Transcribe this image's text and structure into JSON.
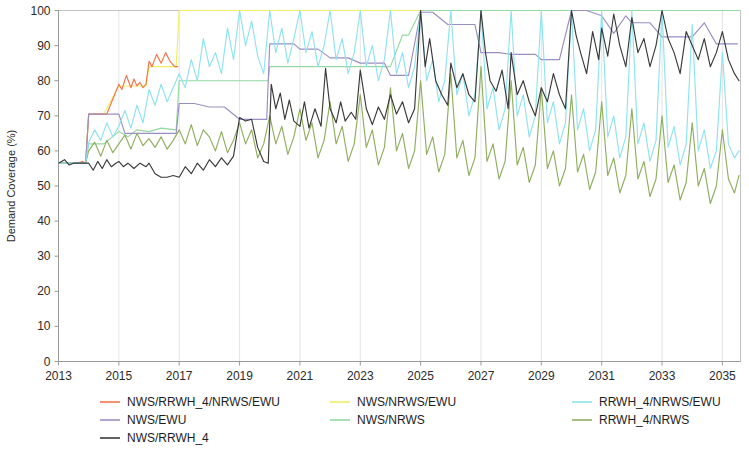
{
  "chart_data": {
    "type": "line",
    "title": "",
    "xlabel": "",
    "ylabel": "Demand Coverage (%)",
    "xlim": [
      2013,
      2035.6
    ],
    "ylim": [
      0,
      100
    ],
    "grid": "vertical-faint",
    "legend_position": "below-plot-three-columns",
    "xticks": [
      "2013",
      "2015",
      "2017",
      "2019",
      "2021",
      "2023",
      "2025",
      "2027",
      "2029",
      "2031",
      "2033",
      "2035"
    ],
    "xtick_values": [
      2013,
      2015,
      2017,
      2019,
      2021,
      2023,
      2025,
      2027,
      2029,
      2031,
      2033,
      2035
    ],
    "yticks": [
      "0",
      "10",
      "20",
      "30",
      "40",
      "50",
      "60",
      "70",
      "80",
      "90",
      "100"
    ],
    "ytick_values": [
      0,
      10,
      20,
      30,
      40,
      50,
      60,
      70,
      80,
      90,
      100
    ],
    "series": [
      {
        "name": "NWS/RRWH_4/NRWS/EWU",
        "color": "#f4744a",
        "x": [
          2013.0,
          2013.6,
          2013.8,
          2013.9,
          2014.0,
          2014.3,
          2014.6,
          2015.0,
          2015.1,
          2015.25,
          2015.4,
          2015.5,
          2015.6,
          2015.7,
          2015.8,
          2015.9,
          2016.0,
          2016.1,
          2016.25,
          2016.4,
          2016.55,
          2016.7,
          2016.85,
          2016.95
        ],
        "values": [
          56.5,
          56.5,
          57.0,
          56.5,
          70.5,
          70.5,
          70.5,
          79.0,
          77.5,
          81.5,
          78.0,
          80.5,
          78.5,
          79.5,
          78.0,
          79.0,
          85.5,
          84.0,
          87.5,
          85.0,
          88.0,
          85.5,
          84.0,
          84.0
        ]
      },
      {
        "name": "NWS/EWU",
        "color": "#9b8ec4",
        "x": [
          2013.0,
          2013.9,
          2014.0,
          2014.5,
          2015.0,
          2015.2,
          2015.5,
          2016.0,
          2016.5,
          2016.9,
          2017.0,
          2017.5,
          2018.0,
          2018.5,
          2019.0,
          2019.5,
          2019.9,
          2020.0,
          2020.8,
          2021.0,
          2021.6,
          2022.0,
          2022.6,
          2023.0,
          2023.8,
          2024.0,
          2024.6,
          2025.0,
          2025.4,
          2025.9,
          2026.0,
          2026.8,
          2027.0,
          2027.6,
          2028.0,
          2028.8,
          2029.0,
          2029.6,
          2030.0,
          2030.5,
          2031.0,
          2031.4,
          2031.8,
          2032.0,
          2032.6,
          2033.0,
          2033.5,
          2034.0,
          2034.4,
          2034.8,
          2035.0,
          2035.5
        ],
        "values": [
          56.5,
          56.5,
          70.5,
          70.5,
          70.5,
          65.0,
          65.0,
          65.0,
          65.0,
          65.0,
          73.5,
          73.5,
          72.5,
          72.5,
          69.0,
          69.0,
          69.0,
          90.5,
          90.5,
          89.0,
          89.0,
          86.5,
          86.5,
          85.0,
          85.0,
          81.5,
          81.5,
          99.5,
          99.5,
          96.0,
          96.0,
          96.0,
          88.0,
          88.0,
          87.5,
          87.5,
          86.0,
          86.0,
          100.0,
          100.0,
          98.5,
          93.5,
          98.5,
          96.5,
          96.5,
          92.5,
          92.5,
          92.5,
          96.5,
          90.5,
          90.5,
          90.5
        ]
      },
      {
        "name": "NWS/RRWH_4",
        "color": "#3a3a3a",
        "x": [
          2013.0,
          2013.2,
          2013.35,
          2013.5,
          2013.7,
          2013.9,
          2014.0,
          2014.15,
          2014.3,
          2014.45,
          2014.6,
          2014.75,
          2014.9,
          2015.0,
          2015.15,
          2015.3,
          2015.5,
          2015.7,
          2015.9,
          2016.0,
          2016.2,
          2016.4,
          2016.6,
          2016.8,
          2017.0,
          2017.2,
          2017.4,
          2017.6,
          2017.8,
          2018.0,
          2018.2,
          2018.4,
          2018.6,
          2018.8,
          2019.0,
          2019.2,
          2019.4,
          2019.6,
          2019.8,
          2019.95,
          2020.05,
          2020.2,
          2020.35,
          2020.5,
          2020.65,
          2020.8,
          2021.0,
          2021.15,
          2021.3,
          2021.5,
          2021.7,
          2021.85,
          2022.0,
          2022.2,
          2022.35,
          2022.5,
          2022.7,
          2022.85,
          2023.0,
          2023.2,
          2023.4,
          2023.6,
          2023.8,
          2024.0,
          2024.2,
          2024.4,
          2024.6,
          2024.8,
          2025.0,
          2025.15,
          2025.3,
          2025.5,
          2025.7,
          2025.9,
          2026.0,
          2026.2,
          2026.4,
          2026.6,
          2026.8,
          2027.0,
          2027.15,
          2027.3,
          2027.5,
          2027.7,
          2027.9,
          2028.0,
          2028.2,
          2028.4,
          2028.6,
          2028.8,
          2029.0,
          2029.2,
          2029.4,
          2029.6,
          2029.8,
          2030.0,
          2030.15,
          2030.3,
          2030.5,
          2030.7,
          2030.9,
          2031.0,
          2031.2,
          2031.4,
          2031.6,
          2031.8,
          2032.0,
          2032.2,
          2032.4,
          2032.6,
          2032.8,
          2033.0,
          2033.2,
          2033.4,
          2033.6,
          2033.8,
          2034.0,
          2034.2,
          2034.4,
          2034.6,
          2034.8,
          2035.0,
          2035.2,
          2035.4,
          2035.55
        ],
        "values": [
          56.5,
          57.5,
          56.0,
          56.5,
          56.5,
          56.5,
          56.5,
          54.5,
          57.0,
          55.0,
          57.5,
          55.5,
          56.5,
          57.0,
          55.5,
          56.5,
          55.0,
          56.5,
          55.5,
          56.5,
          53.5,
          52.5,
          52.5,
          53.0,
          52.5,
          55.5,
          53.5,
          56.5,
          54.5,
          57.5,
          55.5,
          58.0,
          56.0,
          58.5,
          69.5,
          68.5,
          69.0,
          61.0,
          57.0,
          56.5,
          79.0,
          72.0,
          76.5,
          69.0,
          74.5,
          68.5,
          67.0,
          74.0,
          66.5,
          72.0,
          67.0,
          83.5,
          72.0,
          68.0,
          74.0,
          68.5,
          71.0,
          69.0,
          83.0,
          72.0,
          67.5,
          72.5,
          69.0,
          76.0,
          70.5,
          74.0,
          68.0,
          72.0,
          100.0,
          84.0,
          92.0,
          80.0,
          76.0,
          73.0,
          85.0,
          78.0,
          82.0,
          76.0,
          74.0,
          100.0,
          88.0,
          80.0,
          77.0,
          83.0,
          72.0,
          88.0,
          76.0,
          80.0,
          74.0,
          70.0,
          78.0,
          74.0,
          82.0,
          76.0,
          72.0,
          100.0,
          93.0,
          88.0,
          82.0,
          94.0,
          86.0,
          95.0,
          87.0,
          99.0,
          90.0,
          84.0,
          98.0,
          88.0,
          92.0,
          84.0,
          90.0,
          100.0,
          92.0,
          88.0,
          82.0,
          94.0,
          90.0,
          86.0,
          92.0,
          84.0,
          88.0,
          94.0,
          86.0,
          82.0,
          80.0
        ]
      },
      {
        "name": "NWS/NRWS/EWU",
        "color": "#f2ee60",
        "x": [
          2013.0,
          2013.9,
          2014.0,
          2014.5,
          2015.0,
          2015.2,
          2015.5,
          2015.9,
          2016.0,
          2016.5,
          2016.9,
          2017.0,
          2020.0,
          2025.0,
          2030.0,
          2035.55
        ],
        "values": [
          56.5,
          56.5,
          70.5,
          70.5,
          78.5,
          78.5,
          78.5,
          78.5,
          84.0,
          84.0,
          84.0,
          100.0,
          100.0,
          100.0,
          100.0,
          100.0
        ]
      },
      {
        "name": "NWS/NRWS",
        "color": "#93d9a0",
        "x": [
          2013.0,
          2013.9,
          2014.0,
          2014.5,
          2015.0,
          2015.3,
          2015.6,
          2016.0,
          2016.4,
          2016.9,
          2017.0,
          2017.5,
          2018.0,
          2018.6,
          2019.0,
          2019.6,
          2019.95,
          2020.0,
          2021.0,
          2022.0,
          2023.0,
          2024.0,
          2024.4,
          2024.6,
          2025.0,
          2026.0,
          2028.0,
          2030.0,
          2032.0,
          2035.55
        ],
        "values": [
          56.5,
          56.5,
          62.0,
          62.0,
          65.5,
          64.0,
          66.0,
          65.5,
          66.5,
          66.0,
          80.0,
          80.0,
          80.0,
          80.0,
          80.0,
          80.0,
          80.0,
          84.0,
          84.0,
          84.0,
          84.0,
          84.0,
          93.0,
          93.0,
          100.0,
          100.0,
          100.0,
          100.0,
          100.0,
          100.0
        ]
      },
      {
        "name": "RRWH_4/NRWS/EWU",
        "color": "#8fe3f0",
        "x": [
          2013.0,
          2013.9,
          2014.0,
          2014.2,
          2014.4,
          2014.6,
          2014.8,
          2015.0,
          2015.2,
          2015.4,
          2015.6,
          2015.8,
          2016.0,
          2016.2,
          2016.4,
          2016.6,
          2016.8,
          2017.0,
          2017.2,
          2017.4,
          2017.6,
          2017.8,
          2018.0,
          2018.2,
          2018.4,
          2018.6,
          2018.8,
          2019.0,
          2019.2,
          2019.4,
          2019.6,
          2019.8,
          2020.0,
          2020.2,
          2020.4,
          2020.6,
          2020.8,
          2021.0,
          2021.2,
          2021.4,
          2021.6,
          2021.8,
          2022.0,
          2022.2,
          2022.4,
          2022.6,
          2022.8,
          2023.0,
          2023.2,
          2023.4,
          2023.6,
          2023.8,
          2024.0,
          2024.2,
          2024.4,
          2024.6,
          2024.8,
          2025.0,
          2025.2,
          2025.4,
          2025.6,
          2025.8,
          2026.0,
          2026.2,
          2026.4,
          2026.6,
          2026.8,
          2027.0,
          2027.2,
          2027.4,
          2027.6,
          2027.8,
          2028.0,
          2028.2,
          2028.4,
          2028.6,
          2028.8,
          2029.0,
          2029.2,
          2029.4,
          2029.6,
          2029.8,
          2030.0,
          2030.2,
          2030.4,
          2030.6,
          2030.8,
          2031.0,
          2031.2,
          2031.4,
          2031.6,
          2031.8,
          2032.0,
          2032.2,
          2032.4,
          2032.6,
          2032.8,
          2033.0,
          2033.2,
          2033.4,
          2033.6,
          2033.8,
          2034.0,
          2034.2,
          2034.4,
          2034.6,
          2034.8,
          2035.0,
          2035.2,
          2035.4,
          2035.55
        ],
        "values": [
          56.5,
          56.5,
          62.5,
          66.0,
          63.0,
          68.0,
          64.0,
          67.0,
          71.5,
          66.5,
          73.0,
          68.0,
          77.5,
          73.0,
          79.0,
          74.0,
          78.0,
          82.0,
          78.0,
          86.0,
          80.0,
          92.0,
          84.0,
          88.0,
          82.0,
          95.0,
          86.0,
          100.0,
          90.0,
          97.0,
          87.0,
          82.0,
          100.0,
          88.0,
          95.0,
          85.0,
          92.0,
          100.0,
          88.0,
          94.0,
          84.0,
          90.0,
          100.0,
          86.0,
          92.0,
          82.0,
          88.0,
          100.0,
          84.0,
          90.0,
          80.0,
          86.0,
          100.0,
          82.0,
          88.0,
          78.0,
          84.0,
          100.0,
          80.0,
          86.0,
          74.0,
          80.0,
          100.0,
          76.0,
          82.0,
          70.0,
          76.0,
          100.0,
          72.0,
          78.0,
          66.0,
          72.0,
          100.0,
          70.0,
          76.0,
          64.0,
          70.0,
          100.0,
          68.0,
          74.0,
          62.0,
          68.0,
          100.0,
          66.0,
          72.0,
          60.0,
          66.0,
          100.0,
          64.0,
          70.0,
          58.0,
          64.0,
          100.0,
          62.0,
          68.0,
          57.0,
          63.0,
          100.0,
          61.0,
          67.0,
          56.0,
          62.0,
          96.0,
          60.0,
          66.0,
          55.0,
          60.0,
          88.0,
          62.0,
          58.0,
          60.0
        ]
      },
      {
        "name": "RRWH_4/NRWS",
        "color": "#8fae5e",
        "x": [
          2013.0,
          2013.9,
          2014.0,
          2014.2,
          2014.4,
          2014.6,
          2014.8,
          2015.0,
          2015.2,
          2015.4,
          2015.6,
          2015.8,
          2016.0,
          2016.2,
          2016.4,
          2016.6,
          2016.8,
          2017.0,
          2017.2,
          2017.4,
          2017.6,
          2017.8,
          2018.0,
          2018.2,
          2018.4,
          2018.6,
          2018.8,
          2019.0,
          2019.2,
          2019.4,
          2019.6,
          2019.8,
          2020.0,
          2020.2,
          2020.4,
          2020.6,
          2020.8,
          2021.0,
          2021.2,
          2021.4,
          2021.6,
          2021.8,
          2022.0,
          2022.2,
          2022.4,
          2022.6,
          2022.8,
          2023.0,
          2023.2,
          2023.4,
          2023.6,
          2023.8,
          2024.0,
          2024.2,
          2024.4,
          2024.6,
          2024.8,
          2025.0,
          2025.2,
          2025.4,
          2025.6,
          2025.8,
          2026.0,
          2026.2,
          2026.4,
          2026.6,
          2026.8,
          2027.0,
          2027.2,
          2027.4,
          2027.6,
          2027.8,
          2028.0,
          2028.2,
          2028.4,
          2028.6,
          2028.8,
          2029.0,
          2029.2,
          2029.4,
          2029.6,
          2029.8,
          2030.0,
          2030.2,
          2030.4,
          2030.6,
          2030.8,
          2031.0,
          2031.2,
          2031.4,
          2031.6,
          2031.8,
          2032.0,
          2032.2,
          2032.4,
          2032.6,
          2032.8,
          2033.0,
          2033.2,
          2033.4,
          2033.6,
          2033.8,
          2034.0,
          2034.2,
          2034.4,
          2034.6,
          2034.8,
          2035.0,
          2035.2,
          2035.4,
          2035.55
        ],
        "values": [
          56.5,
          56.5,
          60.0,
          62.5,
          58.5,
          63.0,
          59.5,
          62.0,
          64.5,
          60.5,
          65.0,
          61.5,
          63.5,
          61.0,
          64.0,
          60.5,
          63.0,
          66.0,
          62.0,
          67.5,
          61.5,
          66.0,
          64.0,
          60.0,
          65.5,
          59.5,
          63.0,
          68.0,
          62.0,
          66.0,
          58.0,
          62.0,
          70.0,
          62.0,
          67.0,
          59.0,
          64.0,
          72.0,
          63.0,
          68.0,
          58.0,
          63.0,
          74.0,
          62.0,
          67.0,
          57.0,
          62.0,
          76.0,
          61.0,
          66.0,
          56.0,
          61.0,
          78.0,
          60.0,
          65.0,
          55.0,
          60.0,
          80.0,
          59.0,
          64.0,
          54.0,
          59.0,
          82.0,
          58.0,
          63.0,
          53.0,
          58.0,
          84.0,
          57.0,
          62.0,
          52.0,
          57.0,
          80.0,
          56.0,
          61.0,
          51.0,
          56.0,
          78.0,
          55.0,
          60.0,
          50.0,
          55.0,
          76.0,
          54.0,
          59.0,
          49.0,
          54.0,
          74.0,
          53.0,
          58.0,
          48.0,
          53.0,
          72.0,
          52.0,
          57.0,
          47.0,
          52.0,
          70.0,
          51.0,
          56.0,
          46.0,
          51.0,
          68.0,
          50.0,
          55.0,
          45.0,
          50.0,
          66.0,
          52.0,
          48.0,
          53.0
        ]
      }
    ]
  },
  "legend": {
    "entries": [
      {
        "label": "NWS/RRWH_4/NRWS/EWU",
        "color": "#f4744a",
        "col": 0,
        "row": 0
      },
      {
        "label": "NWS/EWU",
        "color": "#9b8ec4",
        "col": 0,
        "row": 1
      },
      {
        "label": "NWS/RRWH_4",
        "color": "#3a3a3a",
        "col": 0,
        "row": 2
      },
      {
        "label": "NWS/NRWS/EWU",
        "color": "#f2ee60",
        "col": 1,
        "row": 0
      },
      {
        "label": "NWS/NRWS",
        "color": "#93d9a0",
        "col": 1,
        "row": 1
      },
      {
        "label": "RRWH_4/NRWS/EWU",
        "color": "#8fe3f0",
        "col": 2,
        "row": 0
      },
      {
        "label": "RRWH_4/NRWS",
        "color": "#8fae5e",
        "col": 2,
        "row": 1
      }
    ]
  }
}
